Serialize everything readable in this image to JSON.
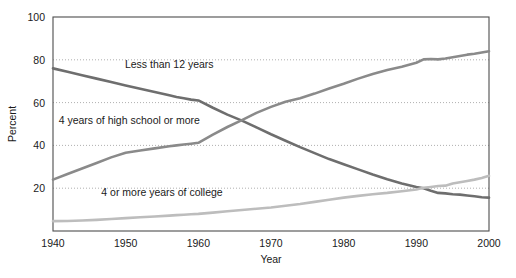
{
  "chart_data": {
    "type": "line",
    "title": "",
    "subtitle": "",
    "xlabel": "Year",
    "ylabel": "Percent",
    "xlim": [
      1940,
      2000
    ],
    "ylim": [
      0,
      100
    ],
    "xticks": [
      1940,
      1950,
      1960,
      1970,
      1980,
      1990,
      2000
    ],
    "yticks": [
      20,
      40,
      60,
      80,
      100
    ],
    "grid": "horizontal-dotted",
    "legend_position": "inline-annotations",
    "colors": {
      "less_than_12_years": "#6e6e6e",
      "high_school_or_more": "#8a8a8a",
      "college_4_or_more": "#bdbdbd",
      "axis": "#4d4d4d",
      "grid": "#9a9a9a",
      "text": "#1a1a1a",
      "background": "#ffffff"
    },
    "x": [
      1940,
      1942,
      1944,
      1946,
      1948,
      1950,
      1952,
      1954,
      1956,
      1957,
      1958,
      1959,
      1960,
      1962,
      1964,
      1966,
      1968,
      1970,
      1972,
      1974,
      1976,
      1978,
      1980,
      1982,
      1984,
      1986,
      1988,
      1990,
      1991,
      1992,
      1993,
      1994,
      1995,
      1996,
      1997,
      1998,
      1999,
      2000
    ],
    "series": [
      {
        "name": "Less than 12 years",
        "label": "Less than 12 years",
        "color": "#6e6e6e",
        "values": [
          76.0,
          74.4,
          72.8,
          71.2,
          69.6,
          68.0,
          66.5,
          65.0,
          63.4,
          62.6,
          62.0,
          61.4,
          61.0,
          57.6,
          54.4,
          51.6,
          48.4,
          45.2,
          42.2,
          39.2,
          36.4,
          33.6,
          31.2,
          28.8,
          26.4,
          24.2,
          22.2,
          20.6,
          20.0,
          18.8,
          17.8,
          17.6,
          17.2,
          17.0,
          16.6,
          16.2,
          15.8,
          15.6
        ]
      },
      {
        "name": "4 years of high school or more",
        "label": "4 years of high school or more",
        "color": "#8a8a8a",
        "values": [
          24.0,
          26.6,
          29.2,
          31.8,
          34.4,
          36.6,
          37.6,
          38.6,
          39.6,
          40.0,
          40.4,
          40.8,
          41.2,
          45.0,
          48.6,
          51.8,
          55.2,
          58.0,
          60.4,
          62.0,
          64.2,
          66.6,
          68.8,
          71.2,
          73.4,
          75.2,
          76.8,
          78.6,
          80.2,
          80.4,
          80.2,
          80.6,
          81.2,
          81.8,
          82.4,
          82.8,
          83.4,
          84.0
        ]
      },
      {
        "name": "4 or more years of college",
        "label": "4 or more years of college",
        "color": "#bdbdbd",
        "values": [
          4.6,
          4.7,
          4.9,
          5.2,
          5.6,
          6.0,
          6.4,
          6.8,
          7.2,
          7.4,
          7.6,
          7.8,
          8.0,
          8.6,
          9.2,
          9.8,
          10.4,
          11.0,
          11.8,
          12.6,
          13.6,
          14.6,
          15.6,
          16.4,
          17.2,
          17.8,
          18.6,
          19.4,
          20.2,
          20.6,
          21.0,
          21.2,
          22.2,
          22.8,
          23.4,
          24.0,
          24.8,
          25.8
        ]
      }
    ],
    "annotations": [
      {
        "name": "less-than-12-years-label",
        "text": "Less than 12 years",
        "x": 1956.0,
        "y": 76.0
      },
      {
        "name": "high-school-or-more-label",
        "text": "4 years of high school or more",
        "x": 1950.5,
        "y": 50.0
      },
      {
        "name": "college-label",
        "text": "4 or more years of college",
        "x": 1955.0,
        "y": 16.5
      }
    ]
  }
}
